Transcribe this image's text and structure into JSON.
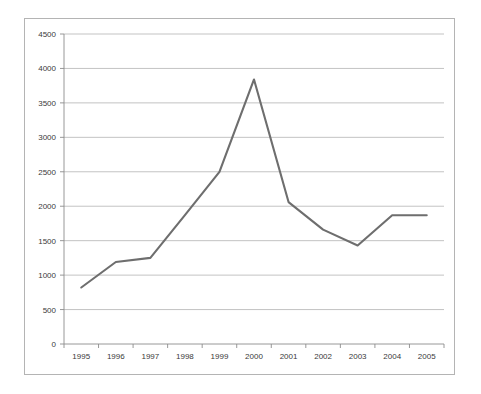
{
  "chart_data": {
    "type": "line",
    "title": "",
    "subtitle": "",
    "xlabel": "",
    "ylabel": "",
    "categories": [
      "1995",
      "1996",
      "1997",
      "1998",
      "1999",
      "2000",
      "2001",
      "2002",
      "2003",
      "2004",
      "2005"
    ],
    "values": [
      820,
      1190,
      1250,
      1870,
      2500,
      3840,
      2060,
      1660,
      1430,
      1870,
      1870
    ],
    "series": [
      {
        "name": "",
        "values": [
          820,
          1190,
          1250,
          1870,
          2500,
          3840,
          2060,
          1660,
          1430,
          1870,
          1870
        ]
      }
    ],
    "ylim": [
      0,
      4500
    ],
    "y_ticks": [
      0,
      500,
      1000,
      1500,
      2000,
      2500,
      3000,
      3500,
      4000,
      4500
    ],
    "y_tick_labels": [
      "0",
      "500",
      "1000",
      "1500",
      "2000",
      "2500",
      "3000",
      "3500",
      "4000",
      "4500"
    ],
    "x_tick_labels": [
      "1995",
      "1996",
      "1997",
      "1998",
      "1999",
      "2000",
      "2001",
      "2002",
      "2003",
      "2004",
      "2005"
    ],
    "grid": true,
    "grid_axis": "y",
    "legend": false,
    "legend_position": "none",
    "annotations": [],
    "colors": {
      "line": "#6e6e6e",
      "gridline": "#a9a9a9",
      "axis": "#8c8c8c",
      "frame": "#b4b4b4",
      "background": "#ffffff",
      "tick_text": "#3a3a3a"
    }
  }
}
